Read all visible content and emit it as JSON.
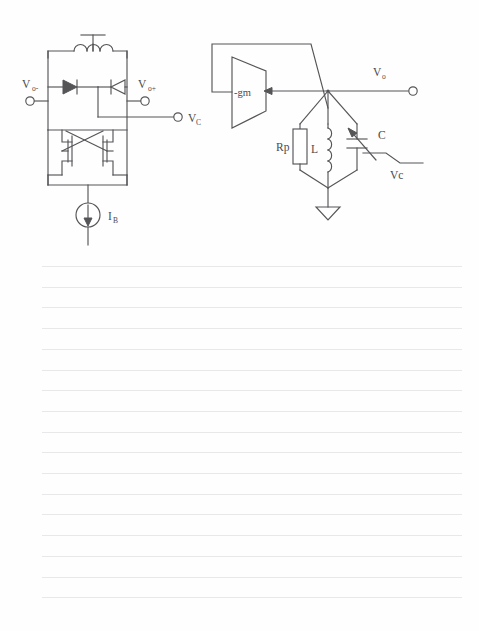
{
  "page": {
    "kind": "notebook-page-scan",
    "background_color": "#fefefe",
    "rule_line_color": "#e8e8ea",
    "ink_color": "#555558",
    "ruled_lines": {
      "first_line_y": 266,
      "last_line_y": 597,
      "spacing": 20.7,
      "count": 17,
      "left_x": 42,
      "right_x": 462
    }
  },
  "figure": {
    "title": "",
    "caption": "",
    "circuits": [
      {
        "id": "cross-coupled-lc-vco",
        "name": "Cross-coupled LC VCO (transistor level)",
        "labels": [
          {
            "key": "vo_minus",
            "base": "V",
            "sub": "o-",
            "text": "Vo-"
          },
          {
            "key": "vo_plus",
            "base": "V",
            "sub": "o+",
            "text": "Vo+"
          },
          {
            "key": "vc",
            "base": "V",
            "sub": "C",
            "text": "VC"
          },
          {
            "key": "ib",
            "base": "I",
            "sub": "B",
            "text": "IB"
          }
        ],
        "components": [
          {
            "type": "inductor",
            "name": "center-tapped-inductor",
            "label": ""
          },
          {
            "type": "varactor-diode",
            "name": "varactor-left",
            "label": ""
          },
          {
            "type": "varactor-diode",
            "name": "varactor-right",
            "label": ""
          },
          {
            "type": "nmos",
            "name": "nmos-left",
            "label": ""
          },
          {
            "type": "nmos",
            "name": "nmos-right",
            "label": ""
          },
          {
            "type": "current-source",
            "name": "bias-current-source",
            "label": "IB"
          }
        ],
        "terminals": [
          {
            "name": "vo-minus-terminal",
            "label": "Vo-"
          },
          {
            "name": "vo-plus-terminal",
            "label": "Vo+"
          },
          {
            "name": "vc-terminal",
            "label": "VC"
          }
        ]
      },
      {
        "id": "negative-gm-rlc-tank",
        "name": "Negative-gm amplifier with parallel RLC tank",
        "labels": [
          {
            "key": "gm",
            "base": "-gm",
            "sub": "",
            "text": "-gm"
          },
          {
            "key": "vo",
            "base": "V",
            "sub": "o",
            "text": "Vo"
          },
          {
            "key": "rp",
            "base": "Rp",
            "sub": "",
            "text": "Rp"
          },
          {
            "key": "l",
            "base": "L",
            "sub": "",
            "text": "L"
          },
          {
            "key": "c",
            "base": "C",
            "sub": "",
            "text": "C"
          },
          {
            "key": "vc_tune",
            "base": "Vc",
            "sub": "",
            "text": "Vc"
          }
        ],
        "components": [
          {
            "type": "amplifier-block",
            "name": "negative-gm-block",
            "label": "-gm"
          },
          {
            "type": "resistor",
            "name": "tank-resistor",
            "label": "Rp"
          },
          {
            "type": "inductor",
            "name": "tank-inductor",
            "label": "L"
          },
          {
            "type": "variable-capacitor",
            "name": "tank-varactor",
            "label": "C"
          },
          {
            "type": "ground",
            "name": "ground-symbol",
            "label": ""
          }
        ],
        "terminals": [
          {
            "name": "vo-output-terminal",
            "label": "Vo"
          }
        ]
      }
    ]
  }
}
